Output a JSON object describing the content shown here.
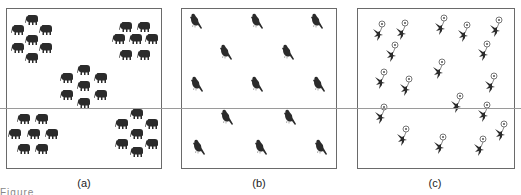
{
  "figure": {
    "panels": [
      {
        "id": "a",
        "label": "(a)",
        "subject": "elephant",
        "pattern": "clumped",
        "count": 35
      },
      {
        "id": "b",
        "label": "(b)",
        "subject": "bird",
        "pattern": "uniform",
        "count": 13
      },
      {
        "id": "c",
        "label": "(c)",
        "subject": "flower",
        "pattern": "random",
        "count": 20
      }
    ],
    "caption_fragment": "Figure"
  },
  "colors": {
    "icon": "#2b2b2b",
    "border": "#6a6a6a",
    "line": "#9a9a9a"
  }
}
